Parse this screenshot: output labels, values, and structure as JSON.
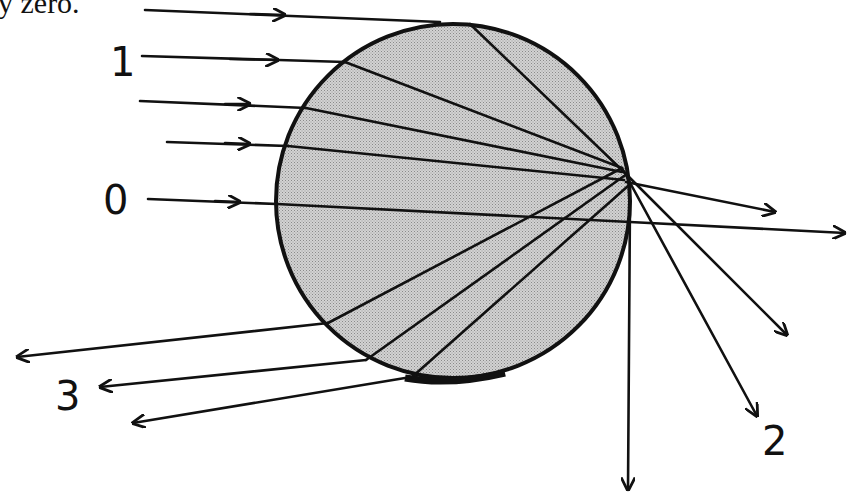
{
  "caption": "y zero.",
  "diagram": {
    "colors": {
      "drop_fill": "#c4c4c4",
      "ink": "#111111",
      "background": "#ffffff"
    },
    "labels": {
      "ray_1": "1",
      "ray_0": "0",
      "ray_3": "3",
      "ray_2": "2"
    }
  }
}
